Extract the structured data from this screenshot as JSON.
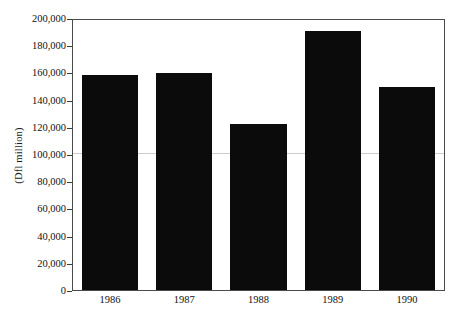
{
  "chart_data": {
    "type": "bar",
    "title": "",
    "subtitle": "",
    "xlabel": "",
    "ylabel": "(Dfl million)",
    "categories": [
      "1986",
      "1987",
      "1988",
      "1989",
      "1990"
    ],
    "values": [
      159000,
      161000,
      123000,
      192000,
      150500
    ],
    "series": [
      {
        "name": "",
        "values": [
          159000,
          161000,
          123000,
          192000,
          150500
        ]
      }
    ],
    "ylim": [
      0,
      200000
    ],
    "xlim_categories": 5,
    "y_ticks": [
      0,
      20000,
      40000,
      60000,
      80000,
      100000,
      120000,
      140000,
      160000,
      180000,
      200000
    ],
    "y_tick_labels": [
      "0",
      "20,000",
      "40,000",
      "60,000",
      "80,000",
      "100,000",
      "120,000",
      "140,000",
      "160,000",
      "180,000",
      "200,000"
    ],
    "x_tick_labels": [
      "1986",
      "1987",
      "1988",
      "1989",
      "1990"
    ],
    "grid": false,
    "legend": false,
    "legend_position": "none",
    "bar_color": "#0b0b0b",
    "axis_color": "#4a4a4a",
    "background_color": "#ffffff",
    "annotations": []
  }
}
